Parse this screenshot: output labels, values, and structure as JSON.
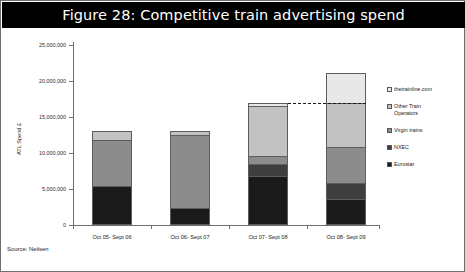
{
  "figure": {
    "title": "Figure 28: Competitive train advertising spend",
    "source": "Source: Neilsen",
    "title_bar_color": "#000000",
    "title_text_color": "#ffffff"
  },
  "chart_data": {
    "type": "bar",
    "stacked": true,
    "title": "Figure 28: Competitive train advertising spend",
    "xlabel": "",
    "ylabel": "ATL Spend £",
    "ylim": [
      0,
      25000000
    ],
    "yticks": [
      0,
      5000000,
      10000000,
      15000000,
      20000000,
      25000000
    ],
    "ytick_labels": [
      "0",
      "5,000,000",
      "10,000,000",
      "15,000,000",
      "20,000,000",
      "25,000,000"
    ],
    "grid": false,
    "legend_position": "right",
    "categories": [
      "Oct 05- Sept 06",
      "Oct 06- Sept 07",
      "Oct 07- Sept 08",
      "Oct 08- Sept 09"
    ],
    "series": [
      {
        "name": "Eurostar",
        "color": "#1a1a1a",
        "values": [
          5400000,
          2350000,
          6800000,
          3650000
        ]
      },
      {
        "name": "NXEC",
        "color": "#3f3f3f",
        "values": [
          0,
          0,
          1700000,
          2150000
        ]
      },
      {
        "name": "Virgin trains",
        "color": "#8c8c8c",
        "values": [
          6400000,
          10150000,
          1100000,
          5100000
        ]
      },
      {
        "name": "Other Train Operators",
        "color": "#c2c2c2",
        "values": [
          1200000,
          500000,
          6900000,
          6000000
        ]
      },
      {
        "name": "thetrainline.com",
        "color": "#e8e8e8",
        "values": [
          0,
          0,
          400000,
          4250000
        ]
      }
    ],
    "totals": [
      13000000,
      13000000,
      16900000,
      21150000
    ],
    "annotations": [
      {
        "type": "dashed-line",
        "label": "",
        "from_category": "Oct 07- Sept 08",
        "to_category": "Oct 08- Sept 09",
        "value": 16900000
      }
    ]
  },
  "axes": {
    "y_title": "ATL Spend £",
    "y_ticks": [
      {
        "label": "25,000,000",
        "value": 25000000
      },
      {
        "label": "20,000,000",
        "value": 20000000
      },
      {
        "label": "15,000,000",
        "value": 15000000
      },
      {
        "label": "10,000,000",
        "value": 10000000
      },
      {
        "label": "5,000,000",
        "value": 5000000
      },
      {
        "label": "0",
        "value": 0
      }
    ],
    "x_ticks": [
      {
        "label": "Oct 05- Sept 06"
      },
      {
        "label": "Oct 06- Sept 07"
      },
      {
        "label": "Oct 07- Sept 08"
      },
      {
        "label": "Oct 08- Sept 09"
      }
    ]
  },
  "legend": {
    "items": [
      {
        "label": "thetrainline.com",
        "color": "#e8e8e8"
      },
      {
        "label": "Other Train\nOperators",
        "color": "#c2c2c2"
      },
      {
        "label": "Virgin trains",
        "color": "#8c8c8c"
      },
      {
        "label": "NXEC",
        "color": "#3f3f3f"
      },
      {
        "label": "Eurostar",
        "color": "#1a1a1a"
      }
    ]
  }
}
